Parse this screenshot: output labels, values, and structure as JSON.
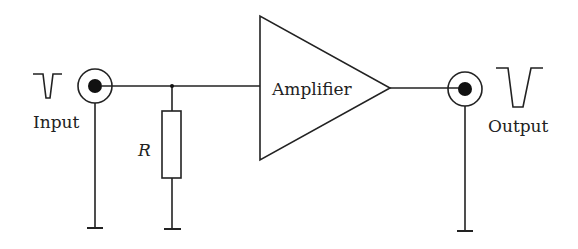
{
  "diagram": {
    "type": "circuit-schematic",
    "labels": {
      "input": "Input",
      "output": "Output",
      "resistor": "R",
      "amplifier": "Amplifier"
    },
    "components": [
      {
        "id": "input-connector",
        "kind": "coaxial-connector"
      },
      {
        "id": "resistor",
        "kind": "resistor",
        "label": "R"
      },
      {
        "id": "amplifier",
        "kind": "amplifier-triangle",
        "label": "Amplifier"
      },
      {
        "id": "output-connector",
        "kind": "coaxial-connector"
      },
      {
        "id": "ground-input",
        "kind": "ground"
      },
      {
        "id": "ground-resistor",
        "kind": "ground"
      },
      {
        "id": "ground-output",
        "kind": "ground"
      }
    ],
    "signals": {
      "input_pulse": "negative pulse (small)",
      "output_pulse": "negative pulse (large)"
    },
    "colors": {
      "stroke": "#222222",
      "background": "#ffffff"
    }
  }
}
